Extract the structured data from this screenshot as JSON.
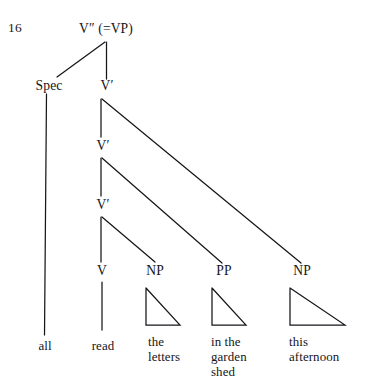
{
  "figure": {
    "number": "16",
    "kind": "syntactic-tree-diagram",
    "ink_color": "#15161a",
    "background_color": "#ffffff"
  },
  "nodes": {
    "root": {
      "label": "V″ (=VP)",
      "base": "V",
      "prime": "″",
      "annotation": "(=VP)"
    },
    "spec": {
      "label": "Spec"
    },
    "vbar1": {
      "label": "V′"
    },
    "vbar2": {
      "label": "V′"
    },
    "vbar3": {
      "label": "V′"
    },
    "v": {
      "label": "V"
    },
    "np1": {
      "label": "NP"
    },
    "pp": {
      "label": "PP"
    },
    "np2": {
      "label": "NP"
    }
  },
  "leaves": {
    "spec_text": {
      "lines": [
        "all"
      ]
    },
    "v_text": {
      "lines": [
        "read"
      ]
    },
    "np1_text": {
      "lines": [
        "the",
        "letters"
      ]
    },
    "pp_text": {
      "lines": [
        "in the",
        "garden",
        "shed"
      ]
    },
    "np2_text": {
      "lines": [
        "this",
        "afternoon"
      ]
    }
  },
  "sentence": "all read the letters in the garden shed this afternoon"
}
